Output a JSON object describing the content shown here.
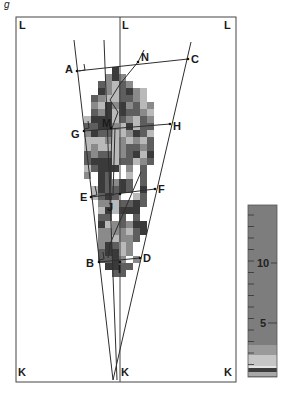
{
  "figure": {
    "panel_label": "g",
    "frame": {
      "left": 16,
      "right": 236,
      "top": 17,
      "bottom": 382,
      "mid_x": 120
    },
    "corner_labels": [
      {
        "text": "L",
        "x": 19,
        "y": 29
      },
      {
        "text": "L",
        "x": 122,
        "y": 29
      },
      {
        "text": "L",
        "x": 224,
        "y": 29
      },
      {
        "text": "K",
        "x": 18,
        "y": 376
      },
      {
        "text": "K",
        "x": 121,
        "y": 376
      },
      {
        "text": "K",
        "x": 224,
        "y": 376
      }
    ],
    "points": [
      {
        "name": "A",
        "x": 77,
        "y": 71,
        "lx": 65,
        "ly": 73
      },
      {
        "name": "N",
        "x": 138,
        "y": 62,
        "lx": 141,
        "ly": 61
      },
      {
        "name": "C",
        "x": 188,
        "y": 59,
        "lx": 191,
        "ly": 63
      },
      {
        "name": "G",
        "x": 84,
        "y": 131,
        "lx": 71,
        "ly": 138
      },
      {
        "name": "M",
        "x": 111,
        "y": 128,
        "lx": 102,
        "ly": 127
      },
      {
        "name": "H",
        "x": 170,
        "y": 124,
        "lx": 173,
        "ly": 130
      },
      {
        "name": "E",
        "x": 91,
        "y": 197,
        "lx": 80,
        "ly": 201
      },
      {
        "name": "J",
        "x": 120,
        "y": 194,
        "lx": 107,
        "ly": 211
      },
      {
        "name": "F",
        "x": 155,
        "y": 189,
        "lx": 158,
        "ly": 193
      },
      {
        "name": "B",
        "x": 99,
        "y": 262,
        "lx": 86,
        "ly": 267
      },
      {
        "name": "I",
        "x": 120,
        "y": 262,
        "lx": 118,
        "ly": 273
      },
      {
        "name": "D",
        "x": 140,
        "y": 258,
        "lx": 143,
        "ly": 262
      }
    ],
    "apex": {
      "x": 113,
      "y": 380
    },
    "colorbar": {
      "x": 248,
      "y": 205,
      "width": 29,
      "height": 172,
      "tick_labels": [
        "10",
        "5"
      ],
      "tick_label_positions": [
        263,
        323
      ],
      "value_range": [
        0,
        15
      ],
      "colors": {
        "bulk": "#7d7d7d",
        "mid": "#9a9a9a",
        "light": "#c6c6c6",
        "dark": "#3c3c3c"
      }
    },
    "colors": {
      "line": "#333333",
      "frame": "#444444",
      "dark_pixel": "#3a3a3a",
      "mid_dark_pixel": "#5e5e5e",
      "mid_pixel": "#8a8a8a",
      "light_pixel": "#b9b9b9",
      "white_pixel": "#ffffff"
    }
  }
}
